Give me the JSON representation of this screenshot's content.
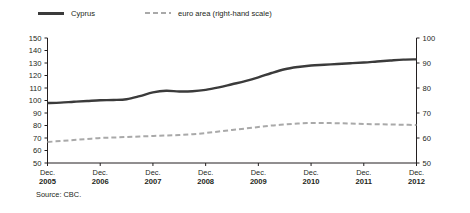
{
  "legend": {
    "items": [
      {
        "label": "Cyprus",
        "style": "solid",
        "color": "#3b3b3b",
        "axis": "left"
      },
      {
        "label": "euro area (right-hand scale)",
        "style": "dashed",
        "color": "#a9a9a9",
        "axis": "right"
      }
    ]
  },
  "source_note": "Source: CBC.",
  "chart_data": {
    "type": "line",
    "title": "",
    "xlabel": "",
    "ylabel": "",
    "grid": false,
    "legend_position": "top-left",
    "x_tick_months": [
      "Dec.",
      "Dec.",
      "Dec.",
      "Dec.",
      "Dec.",
      "Dec.",
      "Dec.",
      "Dec."
    ],
    "x_tick_years": [
      "2005",
      "2006",
      "2007",
      "2008",
      "2009",
      "2010",
      "2011",
      "2012"
    ],
    "categories": [
      "2005",
      "2006",
      "2007",
      "2008",
      "2009",
      "2010",
      "2011",
      "2012"
    ],
    "left_axis": {
      "label": "",
      "ylim": [
        50,
        150
      ],
      "ticks": [
        50,
        60,
        70,
        80,
        90,
        100,
        110,
        120,
        130,
        140,
        150
      ]
    },
    "right_axis": {
      "label": "right-hand scale",
      "ylim": [
        50,
        100
      ],
      "ticks": [
        50,
        60,
        70,
        80,
        90,
        100
      ]
    },
    "series": [
      {
        "name": "Cyprus",
        "axis": "left",
        "color": "#3b3b3b",
        "style": "solid",
        "x": [
          2005.0,
          2005.25,
          2005.5,
          2005.75,
          2006.0,
          2006.25,
          2006.5,
          2006.75,
          2007.0,
          2007.25,
          2007.5,
          2007.75,
          2008.0,
          2008.25,
          2008.5,
          2008.75,
          2009.0,
          2009.25,
          2009.5,
          2009.75,
          2010.0,
          2010.25,
          2010.5,
          2010.75,
          2011.0,
          2011.25,
          2011.5,
          2011.75,
          2012.0
        ],
        "values": [
          98.0,
          98.3,
          99.0,
          99.6,
          100.2,
          100.4,
          101.0,
          103.5,
          106.5,
          107.8,
          107.2,
          107.4,
          108.5,
          110.5,
          113.0,
          115.5,
          118.5,
          122.0,
          125.0,
          126.8,
          128.0,
          128.6,
          129.2,
          129.8,
          130.4,
          131.2,
          132.0,
          132.7,
          132.9
        ]
      },
      {
        "name": "euro area",
        "axis": "right",
        "color": "#a9a9a9",
        "style": "dashed",
        "x": [
          2005.0,
          2005.25,
          2005.5,
          2005.75,
          2006.0,
          2006.25,
          2006.5,
          2006.75,
          2007.0,
          2007.25,
          2007.5,
          2007.75,
          2008.0,
          2008.25,
          2008.5,
          2008.75,
          2009.0,
          2009.25,
          2009.5,
          2009.75,
          2010.0,
          2010.25,
          2010.5,
          2010.75,
          2011.0,
          2011.25,
          2011.5,
          2011.75,
          2012.0
        ],
        "values": [
          58.4,
          58.8,
          59.2,
          59.6,
          60.0,
          60.2,
          60.4,
          60.6,
          60.8,
          61.0,
          61.2,
          61.5,
          62.0,
          62.6,
          63.2,
          63.8,
          64.4,
          65.0,
          65.4,
          65.8,
          66.0,
          66.0,
          65.9,
          65.8,
          65.6,
          65.5,
          65.4,
          65.3,
          65.2
        ]
      }
    ]
  }
}
